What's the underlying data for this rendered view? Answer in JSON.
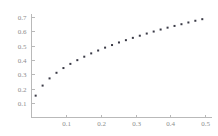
{
  "chart_data": {
    "type": "scatter",
    "title": "",
    "subtitle": "",
    "xlabel": "",
    "ylabel": "",
    "xlim": [
      0,
      0.52
    ],
    "ylim": [
      0,
      0.72
    ],
    "xticks": [
      0.1,
      0.2,
      0.3,
      0.4,
      0.5
    ],
    "xticklabels": [
      "0.1",
      "0.2",
      "0.3",
      "0.4",
      "0.5"
    ],
    "yticks": [
      0.1,
      0.2,
      0.3,
      0.4,
      0.5,
      0.6,
      0.7
    ],
    "yticklabels": [
      "0.1",
      "0.2",
      "0.3",
      "0.4",
      "0.5",
      "0.6",
      "0.7"
    ],
    "grid": false,
    "legend": null,
    "marker": "point",
    "marker_color": "#3a3a46",
    "axis_color": "#b9b9b9",
    "tick_label_color": "#8d8d8d",
    "annotations": [],
    "series": [
      {
        "name": "data",
        "x": [
          0.012,
          0.032,
          0.052,
          0.072,
          0.092,
          0.112,
          0.132,
          0.152,
          0.172,
          0.192,
          0.212,
          0.232,
          0.252,
          0.272,
          0.292,
          0.312,
          0.332,
          0.352,
          0.372,
          0.392,
          0.412,
          0.432,
          0.452,
          0.472,
          0.492
        ],
        "y": [
          0.152,
          0.222,
          0.272,
          0.311,
          0.344,
          0.373,
          0.399,
          0.423,
          0.446,
          0.466,
          0.486,
          0.504,
          0.522,
          0.538,
          0.554,
          0.569,
          0.584,
          0.598,
          0.612,
          0.625,
          0.637,
          0.649,
          0.661,
          0.673,
          0.684
        ]
      }
    ]
  }
}
